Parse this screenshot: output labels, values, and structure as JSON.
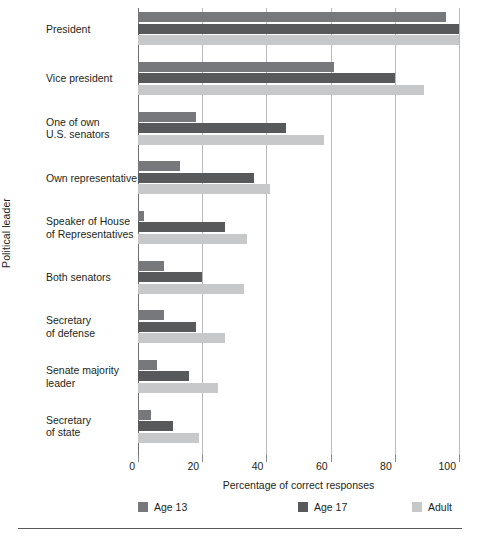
{
  "chart_data": {
    "type": "bar",
    "orientation": "horizontal",
    "title": "",
    "xlabel": "Percentage of correct responses",
    "ylabel": "Political leader",
    "xlim": [
      0,
      100
    ],
    "xticks": [
      0,
      20,
      40,
      60,
      80,
      100
    ],
    "grid": "vertical",
    "legend_position": "bottom",
    "categories": [
      "President",
      "Vice president",
      "One of own\nU.S. senators",
      "Own representative",
      "Speaker of House\nof Representatives",
      "Both senators",
      "Secretary\nof defense",
      "Senate majority\nleader",
      "Secretary\nof state"
    ],
    "category_labels": [
      [
        "President"
      ],
      [
        "Vice president"
      ],
      [
        "One of own",
        "U.S. senators"
      ],
      [
        "Own representative"
      ],
      [
        "Speaker of House",
        "of Representatives"
      ],
      [
        "Both senators"
      ],
      [
        "Secretary",
        "of defense"
      ],
      [
        "Senate majority",
        "leader"
      ],
      [
        "Secretary",
        "of state"
      ]
    ],
    "series": [
      {
        "name": "Age 13",
        "color": "#77787b",
        "values": [
          96,
          61,
          18,
          13,
          2,
          8,
          8,
          6,
          4
        ]
      },
      {
        "name": "Age 17",
        "color": "#58595b",
        "values": [
          100,
          80,
          46,
          36,
          27,
          20,
          18,
          16,
          11
        ]
      },
      {
        "name": "Adult",
        "color": "#c7c8ca",
        "values": [
          100,
          89,
          58,
          41,
          34,
          33,
          27,
          25,
          19
        ]
      }
    ]
  },
  "axis": {
    "x_title": "Percentage of correct responses",
    "y_title": "Political leader",
    "tick_labels": [
      "0",
      "20",
      "40",
      "60",
      "80",
      "100"
    ]
  },
  "legend": {
    "items": [
      {
        "label": "Age 13",
        "color": "#77787b"
      },
      {
        "label": "Age 17",
        "color": "#58595b"
      },
      {
        "label": "Adult",
        "color": "#c7c8ca"
      }
    ]
  }
}
